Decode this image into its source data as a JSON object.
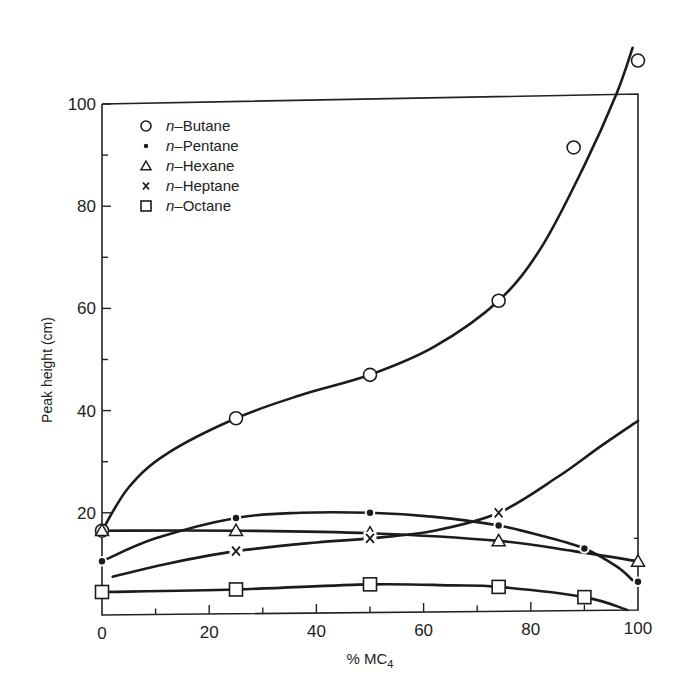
{
  "chart_data": {
    "type": "line",
    "title": "",
    "xlabel": "% MC4",
    "xlabel_main": "% MC",
    "xlabel_sub": "4",
    "ylabel": "Peak height (cm)",
    "xlim": [
      0,
      100
    ],
    "ylim": [
      0,
      100
    ],
    "x_ticks": [
      0,
      20,
      40,
      60,
      80,
      100
    ],
    "x_tick_labels": [
      "0",
      "20",
      "40",
      "60",
      "80",
      "100"
    ],
    "x_minor_ticks": [
      10,
      30,
      50,
      70,
      90
    ],
    "y_ticks": [
      20,
      40,
      60,
      80,
      100
    ],
    "y_tick_labels": [
      "20",
      "40",
      "60",
      "80",
      "100"
    ],
    "y_minor_ticks": [
      30,
      50,
      70,
      90
    ],
    "grid": false,
    "legend_position": "upper-left inside",
    "series": [
      {
        "name": "n-Butane",
        "prefix": "n",
        "suffix": "–Butane",
        "marker": "open-circle",
        "x": [
          0,
          25,
          50,
          74,
          88,
          100
        ],
        "values": [
          16.5,
          38.5,
          47,
          61.5,
          91.5,
          108.5
        ],
        "curve": [
          [
            0,
            16.5
          ],
          [
            5,
            25
          ],
          [
            12,
            31.5
          ],
          [
            25,
            38.5
          ],
          [
            37,
            43
          ],
          [
            50,
            47
          ],
          [
            62,
            52.5
          ],
          [
            74,
            61.5
          ],
          [
            82,
            72
          ],
          [
            90,
            88
          ],
          [
            96,
            102
          ],
          [
            99,
            111
          ]
        ]
      },
      {
        "name": "n-Pentane",
        "prefix": "n",
        "suffix": "–Pentane",
        "marker": "filled-circle",
        "x": [
          0,
          25,
          50,
          74,
          90,
          100
        ],
        "values": [
          10.5,
          19,
          20,
          17.5,
          13,
          6.5
        ],
        "curve": [
          [
            0,
            10.5
          ],
          [
            10,
            15
          ],
          [
            25,
            19
          ],
          [
            37,
            20
          ],
          [
            50,
            20
          ],
          [
            62,
            19.2
          ],
          [
            74,
            17.5
          ],
          [
            82,
            15.5
          ],
          [
            90,
            13
          ],
          [
            96,
            9.5
          ],
          [
            99,
            6.8
          ]
        ]
      },
      {
        "name": "n-Hexane",
        "prefix": "n",
        "suffix": "–Hexane",
        "marker": "open-triangle",
        "x": [
          0,
          25,
          50,
          74,
          100
        ],
        "values": [
          16.5,
          16.5,
          16,
          14.5,
          10.5
        ],
        "curve": [
          [
            0,
            16.5
          ],
          [
            25,
            16.5
          ],
          [
            50,
            16
          ],
          [
            74,
            14.5
          ],
          [
            88,
            12.5
          ],
          [
            100,
            10.5
          ]
        ]
      },
      {
        "name": "n-Heptane",
        "prefix": "n",
        "suffix": "–Heptane",
        "marker": "cross",
        "x": [
          25,
          50,
          74
        ],
        "values": [
          12.5,
          15,
          20
        ],
        "curve": [
          [
            2,
            7.5
          ],
          [
            12,
            10
          ],
          [
            25,
            12.5
          ],
          [
            40,
            14.2
          ],
          [
            50,
            15
          ],
          [
            62,
            16.5
          ],
          [
            74,
            20
          ],
          [
            85,
            27
          ],
          [
            93,
            33
          ],
          [
            100,
            38
          ]
        ]
      },
      {
        "name": "n-Octane",
        "prefix": "n",
        "suffix": "–Octane",
        "marker": "open-square",
        "x": [
          0,
          25,
          50,
          74,
          90
        ],
        "values": [
          4.5,
          5,
          6,
          5.5,
          3.5
        ],
        "curve": [
          [
            0,
            4.5
          ],
          [
            25,
            5
          ],
          [
            50,
            6
          ],
          [
            65,
            5.8
          ],
          [
            74,
            5.5
          ],
          [
            90,
            3.5
          ],
          [
            98,
            1
          ]
        ]
      }
    ]
  },
  "legend": {
    "items": [
      {
        "prefix": "n",
        "suffix": "–Butane",
        "marker": "open-circle"
      },
      {
        "prefix": "n",
        "suffix": "–Pentane",
        "marker": "filled-circle"
      },
      {
        "prefix": "n",
        "suffix": "–Hexane",
        "marker": "open-triangle"
      },
      {
        "prefix": "n",
        "suffix": "–Heptane",
        "marker": "cross"
      },
      {
        "prefix": "n",
        "suffix": "–Octane",
        "marker": "open-square"
      }
    ]
  },
  "colors": {
    "ink": "#1c1c1c",
    "background": "#ffffff"
  }
}
